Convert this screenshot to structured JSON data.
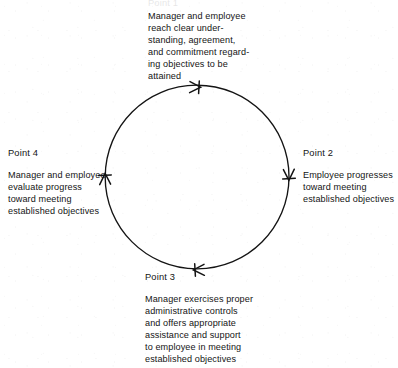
{
  "figure": {
    "kind": "cycle-diagram",
    "direction": "clockwise",
    "ink_color": "#141414",
    "background_color": "#ffffff",
    "circle": {
      "cx": 197,
      "cy": 177,
      "r": 92
    }
  },
  "points": [
    {
      "id": "point1",
      "label": "Point 1",
      "label_visible": false,
      "text": "Manager and employee\nreach clear under-\nstanding, agreement,\nand commitment regard-\ning objectives to be\nattained",
      "arrow": {
        "position": "top",
        "angle_deg": 270,
        "heading": "right"
      }
    },
    {
      "id": "point2",
      "label": "Point 2",
      "label_visible": true,
      "text": "Employee progresses\ntoward meeting\nestablished objectives",
      "arrow": {
        "position": "right",
        "angle_deg": 0,
        "heading": "down"
      }
    },
    {
      "id": "point3",
      "label": "Point 3",
      "label_visible": true,
      "text": "Manager exercises proper\nadministrative controls\nand offers appropriate\nassistance and support\nto employee in meeting\nestablished objectives",
      "arrow": {
        "position": "bottom",
        "angle_deg": 90,
        "heading": "left"
      }
    },
    {
      "id": "point4",
      "label": "Point 4",
      "label_visible": true,
      "text": "Manager and employee\nevaluate progress\ntoward meeting\nestablished objectives",
      "arrow": {
        "position": "left",
        "angle_deg": 180,
        "heading": "up"
      }
    }
  ]
}
